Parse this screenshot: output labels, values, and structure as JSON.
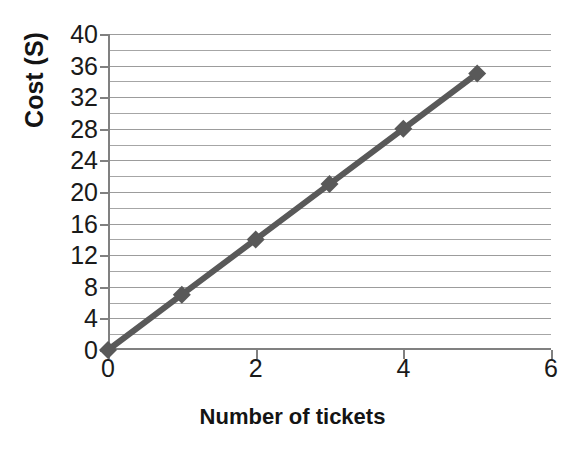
{
  "chart_data": {
    "type": "line",
    "title": "",
    "xlabel": "Number of tickets",
    "ylabel": "Cost (S)",
    "x": [
      0,
      1,
      2,
      3,
      4,
      5
    ],
    "values": [
      0,
      7,
      14,
      21,
      28,
      35
    ],
    "series": [
      {
        "name": "Cost",
        "x": [
          0,
          1,
          2,
          3,
          4,
          5
        ],
        "values": [
          0,
          7,
          14,
          21,
          28,
          35
        ],
        "color": "#595959",
        "marker": "diamond"
      }
    ],
    "xlim": [
      0,
      6
    ],
    "ylim": [
      0,
      40
    ],
    "x_ticks": [
      0,
      2,
      4,
      6
    ],
    "x_tick_labels": [
      "0",
      "2",
      "4",
      "6"
    ],
    "y_ticks": [
      0,
      4,
      8,
      12,
      16,
      20,
      24,
      28,
      32,
      36,
      40
    ],
    "y_tick_labels": [
      "0",
      "4",
      "8",
      "12",
      "16",
      "20",
      "24",
      "28",
      "32",
      "36",
      "40"
    ],
    "y_minor_gridlines": [
      2,
      6,
      10,
      14,
      18,
      22,
      26,
      30,
      34,
      38
    ],
    "grid": "horizontal",
    "legend": "none",
    "annotations": []
  },
  "colors": {
    "series_line": "#595959",
    "marker_fill": "#595959",
    "gridline": "#a6a6a6",
    "axis": "#808080",
    "text": "#1a1a1a",
    "title_text": "#141414",
    "background": "#ffffff"
  }
}
